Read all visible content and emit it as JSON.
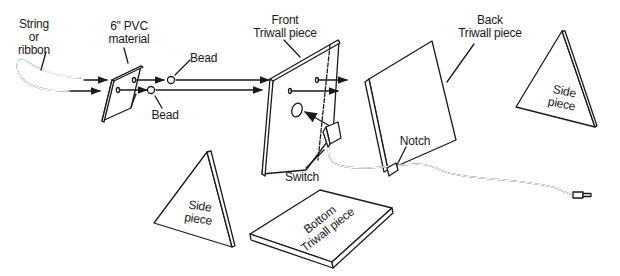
{
  "diagram": {
    "type": "exploded assembly illustration",
    "colors": {
      "line": "#1a1a1a",
      "background": "#ffffff"
    },
    "labels": {
      "string": "String\nor\nribbon",
      "pvc": "6\" PVC\nmaterial",
      "bead_top": "Bead",
      "bead_bottom": "Bead",
      "front": "Front\nTriwall piece",
      "back": "Back\nTriwall piece",
      "side_right": "Side\npiece",
      "side_left": "Side\npiece",
      "notch": "Notch",
      "switch": "Switch",
      "bottom": "Bottom\nTriwall piece"
    },
    "components": [
      "String or ribbon",
      "6\" PVC material",
      "Bead",
      "Bead",
      "Front Triwall piece",
      "Back Triwall piece",
      "Side piece",
      "Side piece",
      "Bottom Triwall piece",
      "Switch",
      "Notch"
    ]
  }
}
